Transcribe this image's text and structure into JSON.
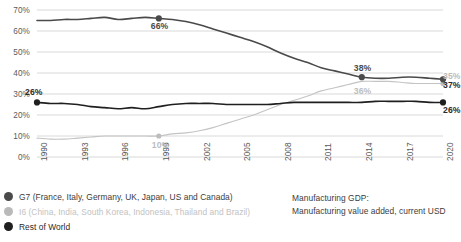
{
  "chart_data": {
    "type": "line",
    "title": "",
    "xlabel": "",
    "ylabel": "",
    "ylim": [
      0,
      70
    ],
    "ytick_labels": [
      "0%",
      "10%",
      "20%",
      "30%",
      "40%",
      "50%",
      "60%",
      "70%"
    ],
    "ytick_values": [
      0,
      10,
      20,
      30,
      40,
      50,
      60,
      70
    ],
    "xtick_labels": [
      "1990",
      "1993",
      "1996",
      "1999",
      "2002",
      "2005",
      "2008",
      "2011",
      "2014",
      "2017",
      "2020"
    ],
    "xtick_values": [
      1990,
      1993,
      1996,
      1999,
      2002,
      2005,
      2008,
      2011,
      2014,
      2017,
      2020
    ],
    "xlim": [
      1990,
      2020
    ],
    "grid": true,
    "grid_axis": "y",
    "legend_position": "bottom-left",
    "x": [
      1990,
      1991,
      1992,
      1993,
      1994,
      1995,
      1996,
      1997,
      1998,
      1999,
      2000,
      2001,
      2002,
      2003,
      2004,
      2005,
      2006,
      2007,
      2008,
      2009,
      2010,
      2011,
      2012,
      2013,
      2014,
      2015,
      2016,
      2017,
      2018,
      2019,
      2020
    ],
    "series": [
      {
        "name": "G7",
        "color": "#4a4a4a",
        "values": [
          65,
          65,
          65.5,
          65.5,
          66,
          66.5,
          65.5,
          66,
          66.5,
          66,
          65.5,
          64.5,
          63,
          61,
          59,
          57,
          55,
          52.5,
          49.5,
          47,
          45,
          42.5,
          41,
          39.5,
          38,
          37.5,
          37.5,
          38,
          38,
          37.5,
          37
        ]
      },
      {
        "name": "I6",
        "color": "#c4c4c4",
        "values": [
          9,
          8.5,
          8.5,
          9,
          9.5,
          10,
          10,
          10,
          10,
          10,
          11,
          11.5,
          12.5,
          14,
          16,
          18,
          20,
          22.5,
          25,
          27,
          29,
          31.5,
          33,
          34.5,
          36,
          36,
          36,
          35.5,
          35,
          35,
          35
        ]
      },
      {
        "name": "Rest of World",
        "color": "#1f1f1f",
        "values": [
          26,
          25.5,
          25.5,
          25,
          24,
          23.5,
          23,
          23.5,
          23,
          24,
          25,
          25.5,
          25.5,
          25.5,
          25,
          25,
          25,
          25,
          25.5,
          26,
          26,
          26,
          26,
          26,
          26,
          26.5,
          26.5,
          26.5,
          26.5,
          26,
          26
        ]
      }
    ],
    "annotations": [
      {
        "label": "26%",
        "series": "Rest of World",
        "x": 1990,
        "y": 26,
        "style": "dark",
        "marker": true
      },
      {
        "label": "66%",
        "series": "G7",
        "x": 1999,
        "y": 66,
        "style": "mid",
        "marker": true
      },
      {
        "label": "38%",
        "series": "G7",
        "x": 2014,
        "y": 38,
        "style": "mid",
        "marker": true
      },
      {
        "label": "36%",
        "series": "I6",
        "x": 2014,
        "y": 36,
        "style": "gray",
        "marker": false
      },
      {
        "label": "10%",
        "series": "I6",
        "x": 1999,
        "y": 10,
        "style": "gray",
        "marker": true
      },
      {
        "label": "35%",
        "series": "I6",
        "x": 2020,
        "y": 35,
        "style": "gray",
        "marker": true
      },
      {
        "label": "37%",
        "series": "G7",
        "x": 2020,
        "y": 37,
        "style": "dark",
        "marker": true
      },
      {
        "label": "26%",
        "series": "Rest of World",
        "x": 2020,
        "y": 26,
        "style": "dark",
        "marker": true
      }
    ]
  },
  "legend": {
    "items": [
      {
        "label": "G7 (France, Italy, Germany, UK, Japan, US and Canada)",
        "color": "#4a4a4a"
      },
      {
        "label": "I6 (China, India, South Korea, Indonesia, Thailand and Brazil)",
        "color": "#b9b9b9"
      },
      {
        "label": "Rest of World",
        "color": "#1f1f1f"
      }
    ]
  },
  "note": {
    "line1": "Manufacturing GDP:",
    "line2": "Manufacturing value added, current USD"
  }
}
